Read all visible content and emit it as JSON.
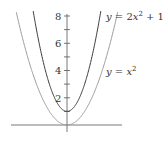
{
  "chart_data": {
    "type": "line",
    "title": "",
    "xlabel": "",
    "ylabel": "",
    "xlim": [
      -3.1,
      3.2
    ],
    "ylim": [
      -0.5,
      8.4
    ],
    "grid": false,
    "y_ticks_major": [
      2,
      4,
      6,
      8
    ],
    "y_ticks_minor": [
      1,
      3,
      5,
      7
    ],
    "y_tick_labels": [
      "2",
      "4",
      "6",
      "8"
    ],
    "series": [
      {
        "name": "y = 2x^2 + 1",
        "label": "y = 2x² + 1",
        "expression": "2*x^2+1",
        "color": "#3a3a3a",
        "x": [
          -1.87,
          -1.5,
          -1.0,
          -0.5,
          0,
          0.5,
          1.0,
          1.5,
          1.87
        ],
        "values": [
          8.0,
          5.5,
          3.0,
          1.5,
          1.0,
          1.5,
          3.0,
          5.5,
          8.0
        ]
      },
      {
        "name": "y = x^2",
        "label": "y = x²",
        "expression": "x^2",
        "color": "#9a9a9a",
        "x": [
          -2.83,
          -2.0,
          -1.0,
          0,
          1.0,
          2.0,
          2.83
        ],
        "values": [
          8.0,
          4.0,
          1.0,
          0.0,
          1.0,
          4.0,
          8.0
        ]
      }
    ],
    "annotations": [
      {
        "text": "y = 2x^2 + 1",
        "position": "upper right"
      },
      {
        "text": "y = x^2",
        "position": "middle right"
      }
    ]
  },
  "labels": {
    "curve1": {
      "y": "y",
      "eq": " = 2",
      "x": "x",
      "sup": "2",
      "rest": " + 1"
    },
    "curve2": {
      "y": "y",
      "eq": " = ",
      "x": "x",
      "sup": "2"
    }
  },
  "ticks": {
    "t8": "8",
    "t6": "6",
    "t4": "4",
    "t2": "2"
  }
}
